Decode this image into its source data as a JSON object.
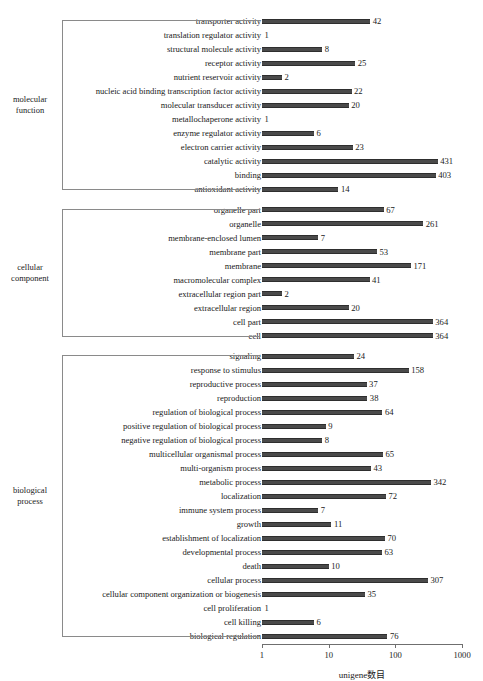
{
  "chart_data": {
    "type": "bar",
    "orientation": "horizontal",
    "title": "",
    "xlabel": "unigene数目",
    "ylabel": "",
    "xscale": "log",
    "xlim": [
      1,
      1000
    ],
    "xticks": [
      1,
      10,
      100,
      1000
    ],
    "xtick_labels": [
      "1",
      "10",
      "100",
      "1000"
    ],
    "grid": false,
    "legend": null,
    "bar_color": "#4a4a4a",
    "groups": [
      {
        "name": "molecular function",
        "label_lines": [
          "molecular",
          "function"
        ],
        "categories": [
          "transporter activity",
          "translation regulator activity",
          "structural molecule activity",
          "receptor activity",
          "nutrient reservoir activity",
          "nucleic acid binding transcription factor activity",
          "molecular transducer activity",
          "metallochaperone activity",
          "enzyme regulator activity",
          "electron carrier activity",
          "catalytic activity",
          "binding",
          "antioxidant activity"
        ],
        "values": [
          42,
          1,
          8,
          25,
          2,
          22,
          20,
          1,
          6,
          23,
          431,
          403,
          14
        ]
      },
      {
        "name": "cellular component",
        "label_lines": [
          "cellular",
          "component"
        ],
        "categories": [
          "organelle part",
          "organelle",
          "membrane-enclosed lumen",
          "membrane part",
          "membrane",
          "macromolecular complex",
          "extracellular region part",
          "extracellular region",
          "cell part",
          "cell"
        ],
        "values": [
          67,
          261,
          7,
          53,
          171,
          41,
          2,
          20,
          364,
          364
        ]
      },
      {
        "name": "biological process",
        "label_lines": [
          "biological",
          "process"
        ],
        "categories": [
          "signaling",
          "response to stimulus",
          "reproductive process",
          "reproduction",
          "regulation of biological process",
          "positive regulation of biological process",
          "negative regulation of biological process",
          "multicellular organismal process",
          "multi-organism process",
          "metabolic process",
          "localization",
          "immune system process",
          "growth",
          "establishment of localization",
          "developmental process",
          "death",
          "cellular process",
          "cellular component organization or biogenesis",
          "cell proliferation",
          "cell killing",
          "biological regulation"
        ],
        "values": [
          24,
          158,
          37,
          38,
          64,
          9,
          8,
          65,
          43,
          342,
          72,
          7,
          11,
          70,
          63,
          10,
          307,
          35,
          1,
          6,
          76
        ]
      }
    ]
  }
}
